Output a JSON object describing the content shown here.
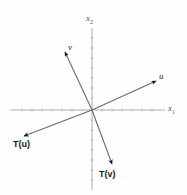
{
  "figure": {
    "background_color": "#fefefe",
    "axis_color": "#9a9a9a",
    "vector_color": "#6b6b6b",
    "arrowhead_color": "#1a1a1a",
    "width": 187,
    "height": 195,
    "origin": {
      "x": 92,
      "y": 110
    }
  },
  "axes": {
    "x_axis": {
      "label": "x",
      "subscript": "1",
      "label_x": 168,
      "label_y": 107,
      "x_start": 10,
      "x_end": 165,
      "y": 110
    },
    "y_axis": {
      "label": "x",
      "subscript": "2",
      "label_x": 86,
      "label_y": 16,
      "y_start": 28,
      "y_end": 190,
      "x": 92
    },
    "tick_spacing": 10,
    "tick_length": 3
  },
  "vectors": [
    {
      "name": "v",
      "label": "v",
      "label_x": 68,
      "label_y": 44,
      "tip_x": 64,
      "tip_y": 50,
      "kind": "domain-vector"
    },
    {
      "name": "u",
      "label": "u",
      "label_x": 159,
      "label_y": 73,
      "tip_x": 157,
      "tip_y": 80,
      "kind": "domain-vector"
    },
    {
      "name": "T(u)",
      "label": "T(u)",
      "label_x": 13,
      "label_y": 139,
      "tip_x": 22,
      "tip_y": 137,
      "kind": "image-vector"
    },
    {
      "name": "T(v)",
      "label": "T(v)",
      "label_x": 99,
      "label_y": 169,
      "tip_x": 113,
      "tip_y": 166,
      "kind": "image-vector"
    }
  ]
}
